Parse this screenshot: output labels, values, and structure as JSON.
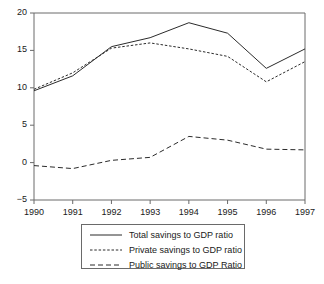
{
  "chart_data": {
    "type": "line",
    "title": "",
    "subtitle": "",
    "xlabel": "",
    "ylabel": "",
    "x": [
      1990,
      1991,
      1992,
      1993,
      1994,
      1995,
      1996,
      1997
    ],
    "categories": [
      "1990",
      "1991",
      "1992",
      "1993",
      "1994",
      "1995",
      "1996",
      "1997"
    ],
    "xlim": [
      1990,
      1997
    ],
    "ylim": [
      -5,
      20
    ],
    "y_ticks": [
      20,
      15,
      10,
      5,
      0,
      -5
    ],
    "y_tick_labels": [
      "20",
      "15",
      "10",
      "5",
      "0",
      "−5"
    ],
    "x_ticks": [
      1990,
      1991,
      1992,
      1993,
      1994,
      1995,
      1996,
      1997
    ],
    "x_tick_labels": [
      "1990",
      "1991",
      "1992",
      "1993",
      "1994",
      "1995",
      "1996",
      "1997"
    ],
    "grid": false,
    "legend_position": "below",
    "series": [
      {
        "name": "Total savings to GDP ratio",
        "style": "solid",
        "color": "#2b2b2b",
        "values": [
          9.6,
          11.6,
          15.5,
          16.7,
          18.7,
          17.3,
          12.6,
          15.2
        ]
      },
      {
        "name": "Private savings to GDP ratio",
        "style": "dotted",
        "color": "#2b2b2b",
        "values": [
          9.8,
          12.0,
          15.3,
          16.0,
          15.2,
          14.2,
          10.8,
          13.5
        ]
      },
      {
        "name": "Public savings to GDP Ratio",
        "style": "dashed",
        "color": "#2b2b2b",
        "values": [
          -0.4,
          -0.8,
          0.3,
          0.7,
          3.5,
          3.0,
          1.8,
          1.7
        ]
      }
    ]
  },
  "legend": {
    "items": [
      {
        "label": "Total savings to GDP ratio",
        "style": "solid"
      },
      {
        "label": "Private savings to GDP ratio",
        "style": "dotted"
      },
      {
        "label": "Public savings to GDP Ratio",
        "style": "dashed"
      }
    ]
  },
  "axes": {
    "y_labels": [
      "20",
      "15",
      "10",
      "5",
      "0",
      "−5"
    ],
    "x_labels": [
      "1990",
      "1991",
      "1992",
      "1993",
      "1994",
      "1995",
      "1996",
      "1997"
    ]
  },
  "colors": {
    "axis": "#6a6a6a",
    "line": "#2b2b2b",
    "text": "#1a1a1a",
    "background": "#ffffff"
  }
}
